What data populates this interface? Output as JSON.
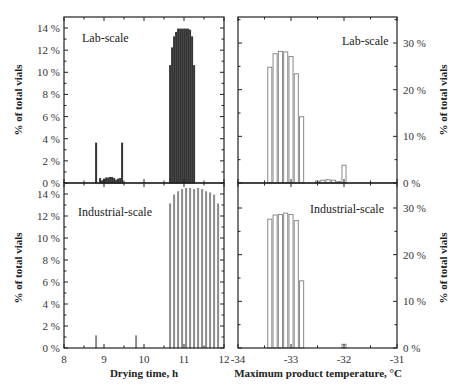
{
  "chart_data": [
    {
      "id": "drying_time_lab",
      "type": "bar",
      "panel_label": "Lab-scale",
      "xlabel": "Drying time, h",
      "ylabel": "% of total vials",
      "xlim": [
        8,
        12
      ],
      "ylim": [
        0,
        14.5
      ],
      "xticks": [
        8,
        9,
        10,
        11,
        12
      ],
      "yticks": [
        0,
        2,
        4,
        6,
        8,
        10,
        12,
        14
      ],
      "ytick_labels": [
        "0 %",
        "2 %",
        "4 %",
        "6 %",
        "8 %",
        "10 %",
        "12 %",
        "14 %"
      ],
      "bar_width": 0.05,
      "bar_style": "dark-outline",
      "x": [
        8.8,
        8.85,
        8.9,
        8.95,
        9.0,
        9.05,
        9.1,
        9.15,
        9.2,
        9.25,
        9.3,
        9.35,
        9.4,
        9.45,
        9.5,
        9.55,
        9.6,
        9.65,
        9.7,
        9.75,
        9.8,
        10.65,
        10.7,
        10.75,
        10.8,
        10.85,
        10.9,
        10.95,
        11.0,
        11.05,
        11.1,
        11.15,
        11.2,
        11.25,
        11.3,
        11.35,
        11.4,
        11.45,
        11.5,
        11.55,
        11.6,
        11.65,
        11.7,
        11.75,
        11.8,
        11.85
      ],
      "values": [
        3.6,
        0,
        0.4,
        0.2,
        0.35,
        0.45,
        0.45,
        0.5,
        0.5,
        0.4,
        0.25,
        0.35,
        0.4,
        3.6,
        0,
        0,
        0,
        0,
        0,
        0,
        0,
        10.6,
        12.2,
        13.2,
        13.6,
        13.9,
        13.9,
        13.9,
        13.9,
        13.9,
        13.9,
        13.8,
        13.2,
        10.6,
        0,
        0,
        0,
        0,
        0,
        0,
        0,
        0,
        0,
        0,
        0,
        0
      ]
    },
    {
      "id": "drying_time_industrial",
      "type": "bar",
      "panel_label": "Industrial-scale",
      "xlabel": "Drying time, h",
      "ylabel": "% of total vials",
      "xlim": [
        8,
        12
      ],
      "ylim": [
        0,
        14.5
      ],
      "xticks": [
        8,
        9,
        10,
        11,
        12
      ],
      "yticks": [
        0,
        2,
        4,
        6,
        8,
        10,
        12,
        14
      ],
      "ytick_labels": [
        "0 %",
        "2 %",
        "4 %",
        "6 %",
        "8 %",
        "10 %",
        "12 %",
        "14 %"
      ],
      "bar_width": 0.05,
      "bar_style": "light-outline",
      "x": [
        8.8,
        9.8,
        10.65,
        10.75,
        10.85,
        10.95,
        11.05,
        11.15,
        11.25,
        11.35,
        11.45,
        11.55,
        11.65,
        11.75,
        11.85
      ],
      "values": [
        1.1,
        1.1,
        13.1,
        13.9,
        14.2,
        14.4,
        14.5,
        14.5,
        14.4,
        14.5,
        14.4,
        14.2,
        14.1,
        13.9,
        13.1
      ]
    },
    {
      "id": "max_temp_lab",
      "type": "bar",
      "panel_label": "Lab-scale",
      "xlabel": "Maximum product temperature, °C",
      "ylabel": "% of total vials",
      "xlim": [
        -34,
        -31
      ],
      "ylim": [
        0,
        35
      ],
      "xticks": [
        -34,
        -33,
        -32,
        -31
      ],
      "yticks": [
        0,
        10,
        20,
        30
      ],
      "ytick_labels": [
        "0 %",
        "10 %",
        "20 %",
        "30 %"
      ],
      "bar_width": 0.1,
      "bar_style": "light-outline",
      "x": [
        -33.4,
        -33.3,
        -33.2,
        -33.1,
        -33.0,
        -32.9,
        -32.8,
        -32.5,
        -32.4,
        -32.3,
        -32.2,
        -32.1,
        -32.0
      ],
      "values": [
        24.8,
        27.7,
        28.2,
        28.1,
        27.1,
        23.4,
        14.2,
        0.4,
        0.6,
        0.7,
        0.6,
        0.3,
        3.8
      ]
    },
    {
      "id": "max_temp_industrial",
      "type": "bar",
      "panel_label": "Industrial-scale",
      "xlabel": "Maximum product temperature, °C",
      "ylabel": "% of total vials",
      "xlim": [
        -34,
        -31
      ],
      "ylim": [
        0,
        35
      ],
      "xticks": [
        -34,
        -33,
        -32,
        -31
      ],
      "yticks": [
        0,
        10,
        20,
        30
      ],
      "ytick_labels": [
        "0 %",
        "10 %",
        "20 %",
        "30 %"
      ],
      "bar_width": 0.1,
      "bar_style": "light-outline",
      "x": [
        -33.4,
        -33.3,
        -33.2,
        -33.1,
        -33.0,
        -32.9,
        -32.8,
        -32.0
      ],
      "values": [
        27.6,
        28.5,
        28.6,
        28.9,
        28.6,
        27.3,
        14.4,
        0.8
      ]
    }
  ],
  "figure": {
    "left_xlabel": "Drying time, h",
    "right_xlabel": "Maximum product temperature, °C",
    "left_ylabel": "% of total vials",
    "right_ylabel": "% of total vials",
    "left_xtick_labels": [
      "8",
      "9",
      "10",
      "11",
      "12"
    ],
    "right_xtick_labels": [
      "-34",
      "-33",
      "-32",
      "-31"
    ],
    "colors": {
      "frame": "#222222",
      "bar_dark": "#333333",
      "bar_light": "#8a8a8a",
      "bar_fill": "#ffffff",
      "text": "#333333"
    }
  }
}
